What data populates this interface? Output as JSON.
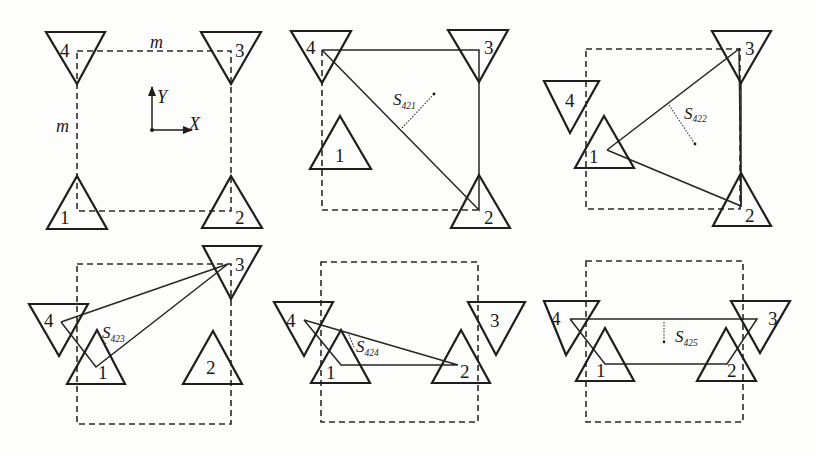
{
  "figure": {
    "colors": {
      "ink": "#1e1e1e",
      "background": "#fdfdfc"
    },
    "panel_1": {
      "dimension_top": "m",
      "dimension_left": "m",
      "axis_y": "Y",
      "axis_x": "X",
      "labels": {
        "t1": "1",
        "t2": "2",
        "t3": "3",
        "t4": "4"
      }
    },
    "panel_2": {
      "area_symbol": "S",
      "area_subscript": "421",
      "labels": {
        "t1": "1",
        "t2": "2",
        "t3": "3",
        "t4": "4"
      }
    },
    "panel_3": {
      "area_symbol": "S",
      "area_subscript": "422",
      "labels": {
        "t1": "1",
        "t2": "2",
        "t3": "3",
        "t4": "4"
      }
    },
    "panel_4": {
      "area_symbol": "S",
      "area_subscript": "423",
      "labels": {
        "t1": "1",
        "t2": "2",
        "t3": "3",
        "t4": "4"
      }
    },
    "panel_5": {
      "area_symbol": "S",
      "area_subscript": "424",
      "labels": {
        "t1": "1",
        "t2": "2",
        "t3": "3",
        "t4": "4"
      }
    },
    "panel_6": {
      "area_symbol": "S",
      "area_subscript": "425",
      "labels": {
        "t1": "1",
        "t2": "2",
        "t3": "3",
        "t4": "4"
      }
    }
  }
}
